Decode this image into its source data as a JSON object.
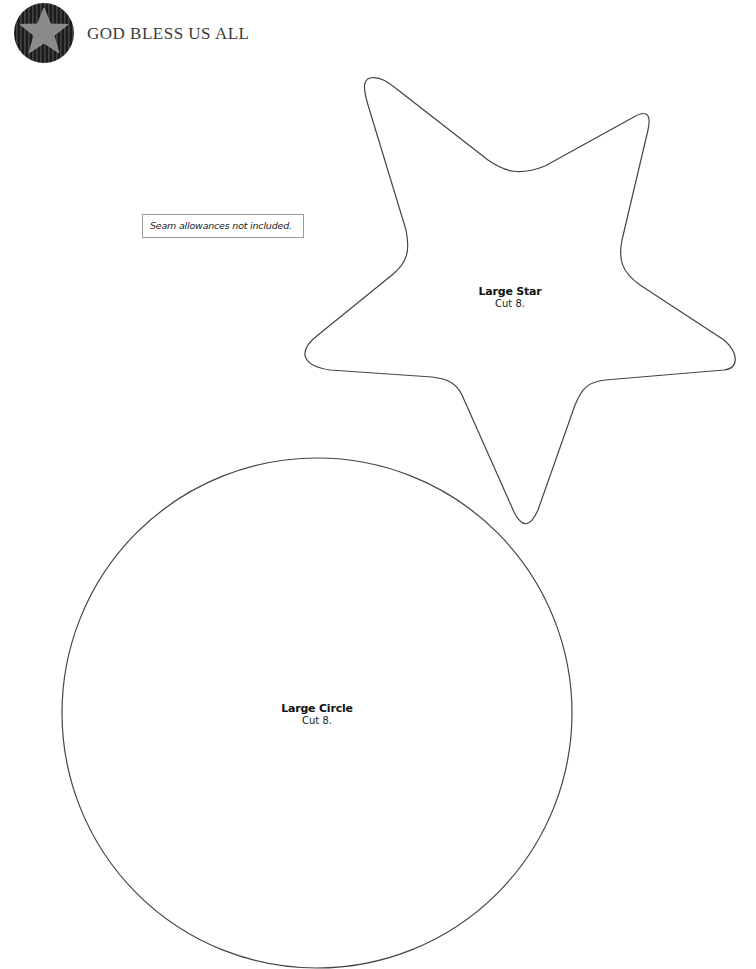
{
  "header": {
    "title": "GOD BLESS US ALL",
    "logo_icon": "star-in-striped-circle-icon"
  },
  "note": {
    "text": "Seam allowances not included."
  },
  "pieces": [
    {
      "shape": "star",
      "name": "Large Star",
      "instruction": "Cut 8."
    },
    {
      "shape": "circle",
      "name": "Large Circle",
      "instruction": "Cut 8."
    }
  ],
  "colors": {
    "outline": "#444444",
    "logo_background": "#1c1c1c",
    "logo_star": "#8a8a8a",
    "title_text": "#3a3a3a"
  }
}
